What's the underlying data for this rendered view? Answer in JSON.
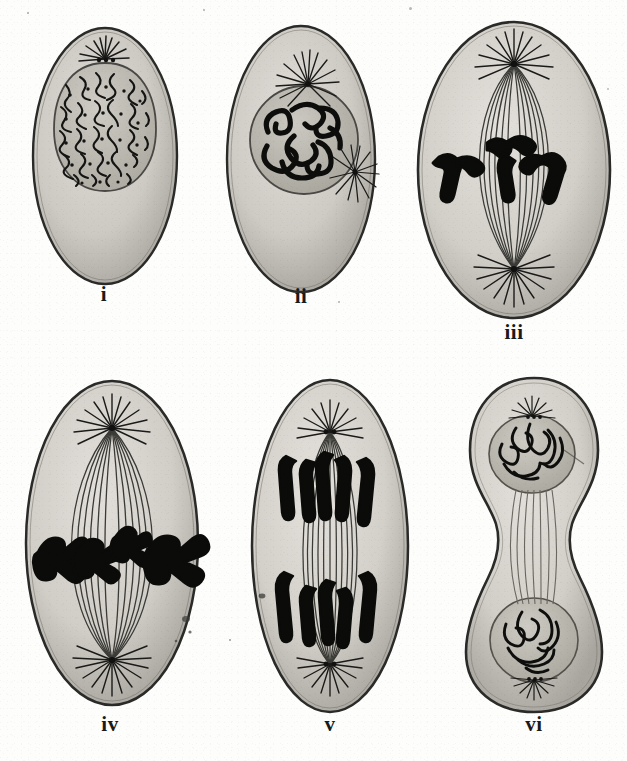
{
  "plate": {
    "title": "Stages of Mitosis (Cell Division)",
    "background_color": "#fdfdfc",
    "ink_color": "#1a1a1a",
    "cytoplasm_color": "#c9c7c2",
    "nucleus_color": "#b5b2ac",
    "width": 627,
    "height": 761,
    "columns": 3,
    "rows": 2
  },
  "figures": [
    {
      "id": "fig-i",
      "label": "i",
      "stage": "interphase-early-prophase",
      "description": "Oval cell with large round nucleus containing a dense reticulum of chromatin threads; single centrosome with small aster at top of nucleus.",
      "cell_shape": "oval",
      "nucleus": true,
      "asters": 1,
      "spindle": false,
      "chromosomes": "chromatin-reticulum",
      "cx": 104,
      "cy": 155,
      "rx": 74,
      "ry": 130,
      "caption_x": 104,
      "caption_y": 285
    },
    {
      "id": "fig-ii",
      "label": "ii",
      "stage": "prophase",
      "description": "Oval cell; nucleus holds thick coiled chromosome threads (spireme); two asters, one above the nucleus and one to the lower right.",
      "cell_shape": "oval",
      "nucleus": true,
      "asters": 2,
      "spindle": false,
      "chromosomes": "thick-coiled-spireme",
      "cx": 301,
      "cy": 160,
      "rx": 76,
      "ry": 135,
      "caption_x": 301,
      "caption_y": 287
    },
    {
      "id": "fig-iii",
      "label": "iii",
      "stage": "metaphase-early",
      "description": "Large oval cell with fully formed bipolar spindle between two polar asters; four V-shaped chromosomes gathered near the equator.",
      "cell_shape": "oval",
      "nucleus": false,
      "asters": 2,
      "spindle": true,
      "chromosomes": "v-shaped-4",
      "cx": 515,
      "cy": 170,
      "rx": 98,
      "ry": 152,
      "caption_x": 515,
      "caption_y": 322
    },
    {
      "id": "fig-iv",
      "label": "iv",
      "stage": "metaphase-late",
      "description": "Oval cell with barrel spindle; chromosomes aligned across the equatorial plate, each splitting into daughter halves.",
      "cell_shape": "oval",
      "nucleus": false,
      "asters": 2,
      "spindle": true,
      "chromosomes": "equatorial-plate-split",
      "cx": 110,
      "cy": 545,
      "rx": 88,
      "ry": 165,
      "caption_x": 110,
      "caption_y": 715
    },
    {
      "id": "fig-v",
      "label": "v",
      "stage": "anaphase",
      "description": "Oval cell; daughter chromosomes drawn apart in two groups toward the opposite spindle poles, trailing spindle fibres between them.",
      "cell_shape": "oval",
      "nucleus": false,
      "asters": 2,
      "spindle": true,
      "chromosomes": "two-separating-groups",
      "cx": 330,
      "cy": 548,
      "rx": 80,
      "ry": 168,
      "caption_x": 330,
      "caption_y": 715
    },
    {
      "id": "fig-vi",
      "label": "vi",
      "stage": "telophase-cytokinesis",
      "description": "Dumb-bell shaped cell constricted at the middle; two reforming daughter nuclei with looped chromatin, connected by remnant spindle fibres.",
      "cell_shape": "dumbbell",
      "nucleus": true,
      "asters": 2,
      "spindle": true,
      "chromosomes": "two-daughter-nuclei",
      "cx": 534,
      "cy": 545,
      "rx": 76,
      "ry": 170,
      "caption_x": 534,
      "caption_y": 715
    }
  ],
  "captions": {
    "i": "i",
    "ii": "ii",
    "iii": "iii",
    "iv": "iv",
    "v": "v",
    "vi": "vi"
  }
}
